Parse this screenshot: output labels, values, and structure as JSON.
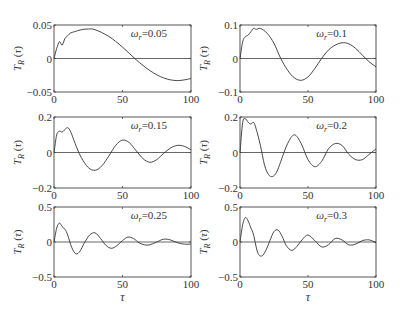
{
  "figure": {
    "xlabel": "τ",
    "ylabel": "T_R(τ)",
    "ylabel_main": "T",
    "ylabel_sub": "R",
    "ylabel_arg": "(τ)"
  },
  "chart_data": [
    {
      "type": "line",
      "title": "",
      "annotation": "ω_r=0.05",
      "omega_r": 0.05,
      "xlabel": "",
      "ylabel": "T_R(τ)",
      "xlim": [
        0,
        100
      ],
      "ylim": [
        -0.05,
        0.05
      ],
      "xticks": [
        "0",
        "50",
        "100"
      ],
      "yticks": [
        "-0.05",
        "0",
        "0.05"
      ],
      "x": [
        0,
        2,
        4,
        6,
        8,
        10,
        12,
        15,
        20,
        25,
        30,
        40,
        50,
        60,
        70,
        80,
        90,
        100
      ],
      "values": [
        0,
        0.015,
        0.025,
        0.02,
        0.03,
        0.034,
        0.038,
        0.04,
        0.043,
        0.044,
        0.043,
        0.033,
        0.017,
        -0.002,
        -0.018,
        -0.029,
        -0.033,
        -0.03
      ]
    },
    {
      "type": "line",
      "title": "",
      "annotation": "ω_r=0.1",
      "omega_r": 0.1,
      "xlabel": "",
      "ylabel": "T_R(τ)",
      "xlim": [
        0,
        100
      ],
      "ylim": [
        -0.1,
        0.1
      ],
      "xticks": [
        "0",
        "50",
        "100"
      ],
      "yticks": [
        "-0.1",
        "0",
        "0.1"
      ],
      "x": [
        0,
        2,
        4,
        6,
        8,
        10,
        12,
        15,
        20,
        25,
        30,
        35,
        40,
        45,
        50,
        55,
        60,
        65,
        70,
        75,
        80,
        85,
        90,
        95,
        100
      ],
      "values": [
        0,
        0.05,
        0.065,
        0.07,
        0.08,
        0.09,
        0.087,
        0.09,
        0.075,
        0.045,
        0.0,
        -0.035,
        -0.058,
        -0.065,
        -0.055,
        -0.03,
        0.0,
        0.025,
        0.04,
        0.047,
        0.044,
        0.03,
        0.01,
        -0.01,
        -0.025
      ]
    },
    {
      "type": "line",
      "title": "",
      "annotation": "ω_r=0.15",
      "omega_r": 0.15,
      "xlabel": "",
      "ylabel": "T_R(τ)",
      "xlim": [
        0,
        100
      ],
      "ylim": [
        -0.2,
        0.2
      ],
      "xticks": [
        "0",
        "50",
        "100"
      ],
      "yticks": [
        "-0.2",
        "0",
        "0.2"
      ],
      "x": [
        0,
        2,
        4,
        6,
        8,
        10,
        12,
        14,
        17,
        20,
        25,
        30,
        35,
        40,
        45,
        50,
        55,
        60,
        65,
        70,
        75,
        80,
        85,
        90,
        95,
        100
      ],
      "values": [
        0,
        0.1,
        0.12,
        0.115,
        0.13,
        0.14,
        0.12,
        0.08,
        0.02,
        -0.03,
        -0.085,
        -0.1,
        -0.075,
        -0.02,
        0.04,
        0.07,
        0.055,
        0.01,
        -0.035,
        -0.055,
        -0.04,
        -0.005,
        0.025,
        0.04,
        0.035,
        0.015
      ]
    },
    {
      "type": "line",
      "title": "",
      "annotation": "ω_r=0.2",
      "omega_r": 0.2,
      "xlabel": "",
      "ylabel": "T_R(τ)",
      "xlim": [
        0,
        100
      ],
      "ylim": [
        -0.2,
        0.2
      ],
      "xticks": [
        "0",
        "50",
        "100"
      ],
      "yticks": [
        "-0.2",
        "0",
        "0.2"
      ],
      "x": [
        0,
        2,
        4,
        6,
        8,
        10,
        12,
        15,
        18,
        21,
        24,
        27,
        30,
        35,
        40,
        45,
        50,
        55,
        60,
        65,
        70,
        75,
        80,
        85,
        90,
        95,
        100
      ],
      "values": [
        0,
        0.17,
        0.19,
        0.17,
        0.16,
        0.17,
        0.13,
        0.04,
        -0.07,
        -0.125,
        -0.135,
        -0.11,
        -0.05,
        0.05,
        0.1,
        0.05,
        -0.04,
        -0.08,
        -0.05,
        0.02,
        0.05,
        0.04,
        -0.01,
        -0.04,
        -0.04,
        -0.01,
        0.02
      ]
    },
    {
      "type": "line",
      "title": "",
      "annotation": "ω_r=0.25",
      "omega_r": 0.25,
      "xlabel": "τ",
      "ylabel": "T_R(τ)",
      "xlim": [
        0,
        100
      ],
      "ylim": [
        -0.5,
        0.5
      ],
      "xticks": [
        "0",
        "50",
        "100"
      ],
      "yticks": [
        "-0.5",
        "0",
        "0.5"
      ],
      "x": [
        0,
        2,
        4,
        6,
        8,
        10,
        13,
        16,
        19,
        22,
        26,
        30,
        34,
        38,
        42,
        46,
        50,
        54,
        58,
        62,
        66,
        70,
        75,
        80,
        85,
        90,
        95,
        100
      ],
      "values": [
        0,
        0.2,
        0.27,
        0.22,
        0.18,
        0.1,
        -0.08,
        -0.17,
        -0.13,
        -0.02,
        0.1,
        0.13,
        0.05,
        -0.05,
        -0.09,
        -0.05,
        0.02,
        0.07,
        0.05,
        -0.01,
        -0.04,
        -0.04,
        0.0,
        0.04,
        0.03,
        -0.01,
        -0.03,
        -0.03
      ]
    },
    {
      "type": "line",
      "title": "",
      "annotation": "ω_r=0.3",
      "omega_r": 0.3,
      "xlabel": "τ",
      "ylabel": "T_R(τ)",
      "xlim": [
        0,
        100
      ],
      "ylim": [
        -0.5,
        0.5
      ],
      "xticks": [
        "0",
        "50",
        "100"
      ],
      "yticks": [
        "-0.5",
        "0",
        "0.5"
      ],
      "x": [
        0,
        2,
        4,
        6,
        8,
        10,
        13,
        16,
        19,
        22,
        25,
        28,
        31,
        34,
        38,
        42,
        46,
        50,
        55,
        60,
        65,
        70,
        75,
        80,
        85,
        90,
        95,
        100
      ],
      "values": [
        0,
        0.25,
        0.35,
        0.3,
        0.2,
        0.1,
        -0.15,
        -0.2,
        -0.12,
        0.02,
        0.15,
        0.17,
        0.08,
        -0.05,
        -0.12,
        -0.06,
        0.04,
        0.1,
        0.02,
        -0.07,
        -0.04,
        0.05,
        0.03,
        -0.04,
        -0.03,
        0.02,
        0.03,
        -0.01
      ]
    }
  ]
}
